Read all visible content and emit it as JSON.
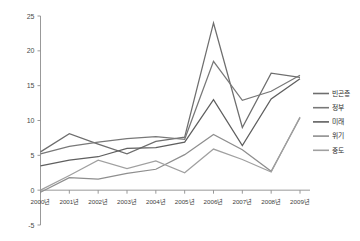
{
  "chart_data": {
    "type": "line",
    "title": "",
    "xlabel": "",
    "ylabel": "",
    "ylim": [
      -5,
      25
    ],
    "yticks": [
      25,
      20,
      15,
      10,
      5,
      0,
      -5
    ],
    "ytick_labels": [
      "25",
      "20",
      "15",
      "10",
      "5",
      "0",
      "-5"
    ],
    "grid": false,
    "legend_position": "right",
    "categories": [
      "2000년",
      "2001년",
      "2002년",
      "2003년",
      "2004년",
      "2005년",
      "2006년",
      "2007년",
      "2008년",
      "2009년"
    ],
    "series": [
      {
        "name": "빈곤층",
        "color": "#6e6e6e",
        "values": [
          5.5,
          8.1,
          6.6,
          5.2,
          7.0,
          7.6,
          24.0,
          9.0,
          16.8,
          16.2
        ]
      },
      {
        "name": "정부",
        "color": "#787878",
        "values": [
          5.2,
          6.3,
          6.9,
          7.4,
          7.7,
          7.3,
          18.5,
          12.9,
          14.2,
          16.5
        ]
      },
      {
        "name": "미래",
        "color": "#5f5f5f",
        "values": [
          3.5,
          4.3,
          4.8,
          6.0,
          6.1,
          6.9,
          13.0,
          6.4,
          13.1,
          16.0
        ]
      },
      {
        "name": "위기",
        "color": "#8e8e8e",
        "values": [
          -0.3,
          1.8,
          1.6,
          2.4,
          3.0,
          5.1,
          8.0,
          5.8,
          2.7,
          10.4
        ]
      },
      {
        "name": "중도",
        "color": "#a0a0a0",
        "values": [
          0.0,
          2.1,
          4.3,
          3.1,
          4.2,
          2.5,
          5.9,
          4.4,
          2.6,
          10.5
        ]
      }
    ]
  },
  "legend": {
    "entries": [
      {
        "label": "빈곤층"
      },
      {
        "label": "정부"
      },
      {
        "label": "미래"
      },
      {
        "label": "위기"
      },
      {
        "label": "중도"
      }
    ]
  }
}
